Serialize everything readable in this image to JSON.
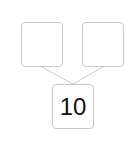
{
  "number_bond": {
    "part_left": "",
    "part_right": "",
    "whole": "10"
  },
  "colors": {
    "border": "#c8c8c8",
    "text": "#111111"
  }
}
